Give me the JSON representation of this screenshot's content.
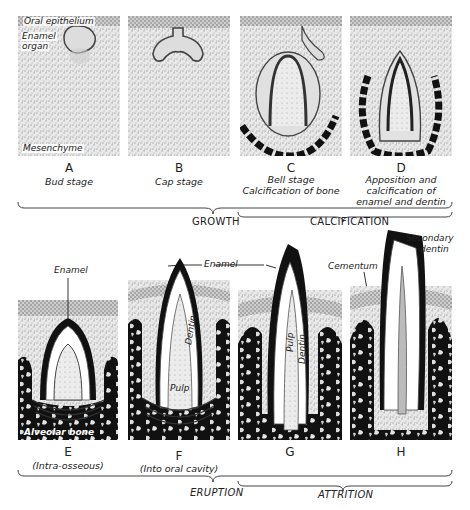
{
  "figure": {
    "colors": {
      "ink": "#111111",
      "stipple": "#9a9a9a",
      "paper": "#ffffff"
    }
  },
  "top_row": {
    "panels": [
      {
        "letter": "A",
        "caption_lines": [
          "Bud stage"
        ],
        "labels": {
          "oral_epithelium": "Oral epithelium",
          "enamel_organ_1": "Enamel",
          "enamel_organ_2": "organ",
          "mesenchyme": "Mesenchyme"
        }
      },
      {
        "letter": "B",
        "caption_lines": [
          "Cap stage"
        ]
      },
      {
        "letter": "C",
        "caption_lines": [
          "Bell stage",
          "Calcification of bone"
        ]
      },
      {
        "letter": "D",
        "caption_lines": [
          "Apposition and",
          "calcification of",
          "enamel and dentin"
        ]
      }
    ],
    "phases": {
      "growth": "GROWTH",
      "calcification": "CALCIFICATION"
    }
  },
  "bottom_row": {
    "panels": [
      {
        "letter": "E",
        "caption": "(Intra-osseous)",
        "labels": {
          "enamel": "Enamel",
          "alveolar_bone": "Alveolar bone"
        }
      },
      {
        "letter": "F",
        "caption": "(Into oral cavity)",
        "labels": {
          "enamel": "Enamel",
          "dentin": "Dentin",
          "pulp": "Pulp"
        }
      },
      {
        "letter": "G",
        "caption": "",
        "labels": {
          "pulp": "Pulp",
          "dentin": "Dentin"
        }
      },
      {
        "letter": "H",
        "caption": "",
        "labels": {
          "cementum": "Cementum",
          "secondary_dentin_1": "Secondary",
          "secondary_dentin_2": "dentin"
        }
      }
    ],
    "phases": {
      "eruption": "ERUPTION",
      "attrition": "ATTRITION"
    }
  }
}
